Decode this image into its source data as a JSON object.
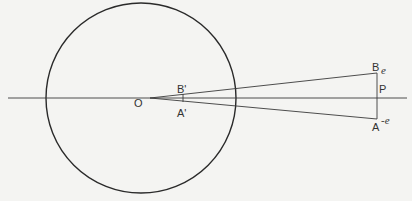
{
  "diagram": {
    "type": "geometric-optics",
    "labels": {
      "O": "O",
      "B_prime": "B'",
      "A_prime": "A'",
      "B": "B",
      "P": "P",
      "A": "A",
      "e_top": "e",
      "e_bottom": "-e"
    },
    "colors": {
      "line": "#2a2a2a",
      "background": "#f4f4f2"
    }
  }
}
